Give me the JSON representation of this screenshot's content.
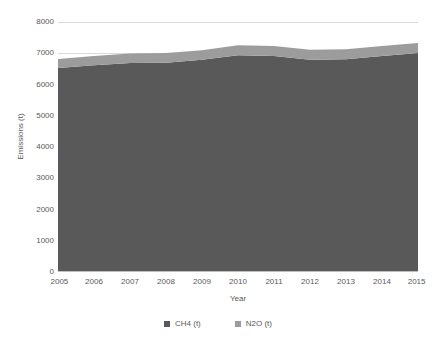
{
  "chart_data": {
    "type": "area",
    "stacked": true,
    "title": "",
    "xlabel": "Year",
    "ylabel": "Emissions (t)",
    "x": [
      2005,
      2006,
      2007,
      2008,
      2009,
      2010,
      2011,
      2012,
      2013,
      2014,
      2015
    ],
    "categories": [
      "2005",
      "2006",
      "2007",
      "2008",
      "2009",
      "2010",
      "2011",
      "2012",
      "2013",
      "2014",
      "2015"
    ],
    "xtick_labels": [
      "2005",
      "2006",
      "2007",
      "2008",
      "2009",
      "2010",
      "2011",
      "2012",
      "2013",
      "2014",
      "2015"
    ],
    "ytick_labels": [
      "0",
      "1000",
      "2000",
      "3000",
      "4000",
      "5000",
      "6000",
      "7000",
      "8000"
    ],
    "yticks": [
      0,
      1000,
      2000,
      3000,
      4000,
      5000,
      6000,
      7000,
      8000
    ],
    "ylim": [
      0,
      8000
    ],
    "xlim": [
      2005,
      2015
    ],
    "grid": "horizontal",
    "legend_position": "bottom",
    "series": [
      {
        "name": "CH4 (t)",
        "color": "#595959",
        "values": [
          6530,
          6620,
          6690,
          6700,
          6790,
          6940,
          6910,
          6790,
          6810,
          6910,
          7010
        ]
      },
      {
        "name": "N2O (t)",
        "color": "#9c9c9c",
        "values": [
          290,
          290,
          300,
          310,
          310,
          320,
          320,
          320,
          320,
          320,
          320
        ]
      }
    ],
    "totals": [
      6820,
      6910,
      6990,
      7010,
      7100,
      7260,
      7230,
      7110,
      7130,
      7230,
      7330
    ]
  },
  "legend": {
    "items": [
      {
        "label": "CH4 (t)",
        "color": "#595959",
        "marker": "square-marker"
      },
      {
        "label": "N2O (t)",
        "color": "#9c9c9c",
        "marker": "square-marker"
      }
    ]
  },
  "axes": {
    "x_title": "Year",
    "y_title": "Emissions (t)"
  }
}
